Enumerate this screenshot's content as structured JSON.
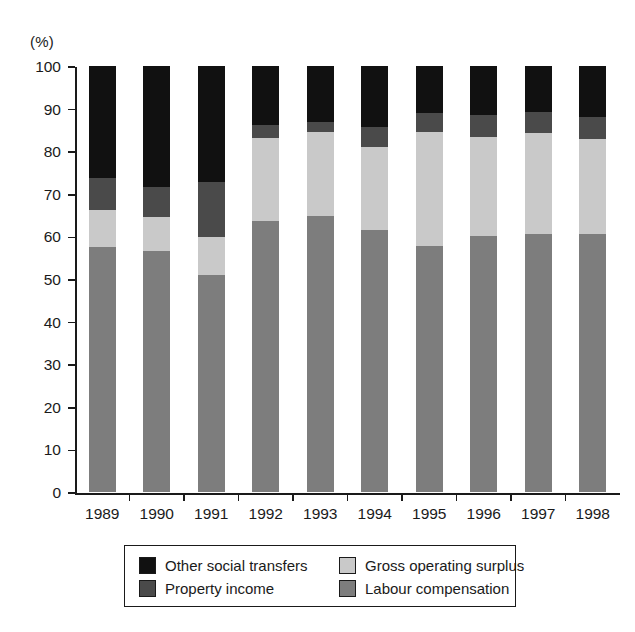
{
  "chart_data": {
    "type": "bar",
    "subtype": "stacked-bar-100",
    "title": "",
    "xlabel": "",
    "ylabel": "(%)",
    "ylim": [
      0,
      100
    ],
    "ytick_labels": [
      "0",
      "10",
      "20",
      "30",
      "40",
      "50",
      "60",
      "70",
      "80",
      "90",
      "100"
    ],
    "ytick_values": [
      0,
      10,
      20,
      30,
      40,
      50,
      60,
      70,
      80,
      90,
      100
    ],
    "grid": false,
    "legend_position": "bottom",
    "categories": [
      "1989",
      "1990",
      "1991",
      "1992",
      "1993",
      "1994",
      "1995",
      "1996",
      "1997",
      "1998"
    ],
    "series": [
      {
        "name": "Labour compensation",
        "color": "#7d7d7d",
        "values": [
          57.5,
          56.5,
          51.0,
          63.5,
          64.8,
          61.5,
          57.8,
          60.0,
          60.5,
          60.5
        ]
      },
      {
        "name": "Gross operating surplus",
        "color": "#c9c9c9",
        "values": [
          8.7,
          8.1,
          8.9,
          19.5,
          19.7,
          19.5,
          26.7,
          23.3,
          23.8,
          22.3
        ]
      },
      {
        "name": "Property income",
        "color": "#4a4a4a",
        "values": [
          7.5,
          7.0,
          12.9,
          3.2,
          2.4,
          4.7,
          4.5,
          5.2,
          4.9,
          5.2
        ]
      },
      {
        "name": "Other social transfers",
        "color": "#111111",
        "values": [
          26.3,
          28.4,
          27.2,
          13.8,
          13.1,
          14.3,
          11.0,
          11.5,
          10.8,
          12.0
        ]
      }
    ]
  },
  "axis": {
    "unit_label": "(%)"
  },
  "legend": {
    "items": [
      {
        "label": "Other social transfers",
        "color": "#111111"
      },
      {
        "label": "Gross operating surplus",
        "color": "#c9c9c9"
      },
      {
        "label": "Property income",
        "color": "#4a4a4a"
      },
      {
        "label": "Labour compensation",
        "color": "#7d7d7d"
      }
    ]
  }
}
